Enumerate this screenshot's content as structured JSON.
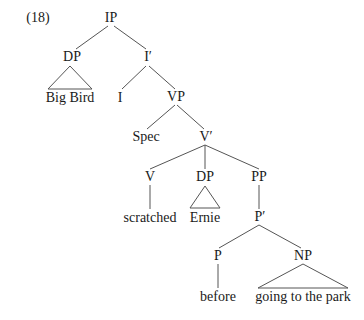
{
  "example_number": "(18)",
  "nodes": {
    "ip": "IP",
    "dp_subject": "DP",
    "i_bar": "I′",
    "big_bird": "Big Bird",
    "i": "I",
    "vp": "VP",
    "spec": "Spec",
    "v_bar": "V′",
    "v": "V",
    "dp_object": "DP",
    "pp": "PP",
    "scratched": "scratched",
    "ernie": "Ernie",
    "p_bar": "P′",
    "p": "P",
    "np": "NP",
    "before": "before",
    "going_to_the_park": "going to the park"
  },
  "colors": {
    "line": "#555555",
    "text": "#1a1a1a"
  }
}
